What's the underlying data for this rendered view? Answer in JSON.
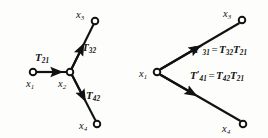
{
  "figure": {
    "type": "signal-flow-graph",
    "stroke_color": "#111111",
    "node_fill_color": "#ffffff",
    "background_color": "#fdfdfc"
  },
  "left_graph": {
    "nodes": [
      {
        "id": "x1",
        "label_base": "x",
        "label_sub": "1",
        "cx": 33,
        "cy": 72,
        "label_x": 26,
        "label_y": 79
      },
      {
        "id": "x2",
        "label_base": "x",
        "label_sub": "2",
        "cx": 70,
        "cy": 72,
        "label_x": 58,
        "label_y": 79
      },
      {
        "id": "x3",
        "label_base": "x",
        "label_sub": "3",
        "cx": 95,
        "cy": 21,
        "label_x": 76,
        "label_y": 10
      },
      {
        "id": "x4",
        "label_base": "x",
        "label_sub": "4",
        "cx": 97,
        "cy": 124,
        "label_x": 79,
        "label_y": 121
      }
    ],
    "edges": [
      {
        "id": "e21",
        "from": "x1",
        "to": "x2",
        "label_base": "T",
        "label_sub": "21",
        "label_x": 35,
        "label_y": 52
      },
      {
        "id": "e32",
        "from": "x2",
        "to": "x3",
        "label_base": "T",
        "label_sub": "32",
        "label_x": 82,
        "label_y": 42
      },
      {
        "id": "e42",
        "from": "x2",
        "to": "x4",
        "label_base": "T",
        "label_sub": "42",
        "label_x": 86,
        "label_y": 90
      }
    ]
  },
  "right_graph": {
    "nodes": [
      {
        "id": "x1",
        "label_base": "x",
        "label_sub": "1",
        "cx": 157,
        "cy": 72,
        "label_x": 139,
        "label_y": 69
      },
      {
        "id": "x3",
        "label_base": "x",
        "label_sub": "3",
        "cx": 242,
        "cy": 20,
        "label_x": 223,
        "label_y": 9
      },
      {
        "id": "x4",
        "label_base": "x",
        "label_sub": "4",
        "cx": 243,
        "cy": 124,
        "label_x": 222,
        "label_y": 124
      }
    ],
    "edges": [
      {
        "id": "e31",
        "from": "x1",
        "to": "x3",
        "lhs_base": "T",
        "lhs_prime": "′",
        "lhs_sub": "31",
        "equals": "=",
        "rhs1_base": "T",
        "rhs1_sub": "32",
        "rhs2_base": "T",
        "rhs2_sub": "21",
        "label_x": 193,
        "label_y": 44
      },
      {
        "id": "e41",
        "from": "x1",
        "to": "x4",
        "lhs_base": "T",
        "lhs_prime": "′",
        "lhs_sub": "41",
        "equals": "=",
        "rhs1_base": "T",
        "rhs1_sub": "42",
        "rhs2_base": "T",
        "rhs2_sub": "21",
        "label_x": 190,
        "label_y": 70
      }
    ]
  }
}
